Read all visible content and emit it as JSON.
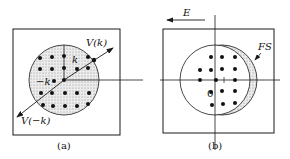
{
  "panel_a": {
    "caption": "(a)",
    "labels": {
      "v_k": "V(k)",
      "v_minus_k": "V(−k)",
      "k": "k",
      "minus_k": "−k"
    },
    "description": "Fermi sphere centered at origin, shaded, with electron states (dots) and symmetric velocity vectors V(k) and V(-k)"
  },
  "panel_b": {
    "caption": "(b)",
    "labels": {
      "field": "E",
      "fermi_surface": "FS",
      "origin": "0"
    },
    "description": "Fermi sphere displaced to the right under applied field E pointing left; shaded crescent indicates shift of Fermi surface"
  },
  "colors": {
    "line": "#1a1a1a",
    "shade": "#d9d9d9",
    "background": "#ffffff"
  }
}
